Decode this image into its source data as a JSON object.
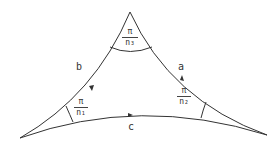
{
  "diagram": {
    "type": "hyperbolic-triangle",
    "stroke_color": "#333333",
    "sides": {
      "a": "a",
      "b": "b",
      "c": "c"
    },
    "angles": {
      "top": {
        "numerator": "π",
        "denominator": "n₃"
      },
      "left": {
        "numerator": "π",
        "denominator": "n₁"
      },
      "right": {
        "numerator": "π",
        "denominator": "n₂"
      }
    }
  }
}
